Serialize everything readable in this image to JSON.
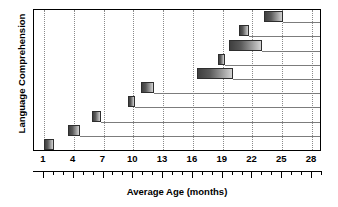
{
  "chart_data": {
    "type": "bar",
    "title": "",
    "xlabel": "Average Age (months)",
    "ylabel": "Language Comprehension",
    "xlim": [
      0,
      29
    ],
    "ylim": [
      0,
      10
    ],
    "grid": true,
    "legend": false,
    "orientation": "horizontal",
    "bar_style": "range-bar-with-leader-line",
    "xticks": [
      1,
      4,
      7,
      10,
      13,
      16,
      19,
      22,
      25,
      28
    ],
    "xtick_labels": [
      "1",
      "4",
      "7",
      "10",
      "13",
      "16",
      "19",
      "22",
      "25",
      "28"
    ],
    "xtick_minor_step": 1,
    "yticks": [],
    "ytick_labels": [],
    "categories": [
      "milestone-1",
      "milestone-2",
      "milestone-3",
      "milestone-4",
      "milestone-5",
      "milestone-6",
      "milestone-7",
      "milestone-8",
      "milestone-9",
      "milestone-10"
    ],
    "bars": [
      {
        "index": 1,
        "start": 1.0,
        "end": 2.0,
        "row": 1,
        "leader_end": 29.0
      },
      {
        "index": 2,
        "start": 3.4,
        "end": 4.6,
        "row": 2,
        "leader_end": 29.0
      },
      {
        "index": 3,
        "start": 5.8,
        "end": 6.7,
        "row": 3,
        "leader_end": 29.0
      },
      {
        "index": 4,
        "start": 9.5,
        "end": 10.2,
        "row": 4,
        "leader_end": 29.0
      },
      {
        "index": 5,
        "start": 10.8,
        "end": 12.1,
        "row": 5,
        "leader_end": 29.0
      },
      {
        "index": 6,
        "start": 16.4,
        "end": 20.0,
        "row": 6,
        "leader_end": 29.0
      },
      {
        "index": 7,
        "start": 18.5,
        "end": 19.2,
        "row": 7,
        "leader_end": 29.0
      },
      {
        "index": 8,
        "start": 19.6,
        "end": 23.0,
        "row": 8,
        "leader_end": 29.0
      },
      {
        "index": 9,
        "start": 20.6,
        "end": 21.6,
        "row": 9,
        "leader_end": 29.0
      },
      {
        "index": 10,
        "start": 23.2,
        "end": 25.1,
        "row": 10,
        "leader_end": 29.0
      }
    ],
    "colors": {
      "bar_gradient_dark": "#3f3f3f",
      "bar_gradient_light": "#d2d2d2",
      "bar_border": "#2e2e2e",
      "gridline": "#8a8a8a",
      "leader_line": "#7c7c7c",
      "axis": "#000000",
      "background": "#ffffff",
      "text": "#000000"
    }
  }
}
